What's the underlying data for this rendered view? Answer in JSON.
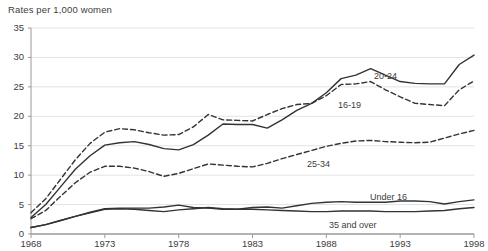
{
  "chart_data": {
    "type": "line",
    "title": "Rates per 1,000 women",
    "xlabel": "",
    "ylabel": "Rates per 1,000 women",
    "xlim": [
      1968,
      1998
    ],
    "ylim": [
      0,
      35
    ],
    "grid": true,
    "legend_position": "inline-annotations",
    "x_ticks": [
      "1968",
      "1973",
      "1978",
      "1983",
      "1988",
      "1993",
      "1998"
    ],
    "x_tick_values": [
      1968,
      1973,
      1978,
      1983,
      1988,
      1993,
      1998
    ],
    "y_ticks": [
      "0",
      "5",
      "10",
      "15",
      "20",
      "25",
      "30",
      "35"
    ],
    "y_tick_values": [
      0,
      5,
      10,
      15,
      20,
      25,
      30,
      35
    ],
    "x": [
      1968,
      1969,
      1970,
      1971,
      1972,
      1973,
      1974,
      1975,
      1976,
      1977,
      1978,
      1979,
      1980,
      1981,
      1982,
      1983,
      1984,
      1985,
      1986,
      1987,
      1988,
      1989,
      1990,
      1991,
      1992,
      1993,
      1994,
      1995,
      1996,
      1997,
      1998
    ],
    "series": [
      {
        "name": "20-24",
        "style": "solid",
        "color": "#333333",
        "label": "20-24",
        "values": [
          2.8,
          5.0,
          8.0,
          11.0,
          13.3,
          15.1,
          15.5,
          15.7,
          15.2,
          14.5,
          14.3,
          15.2,
          16.8,
          18.7,
          18.6,
          18.6,
          18.0,
          19.4,
          21.0,
          22.2,
          24.0,
          26.4,
          27.0,
          28.1,
          27.0,
          25.9,
          25.6,
          25.5,
          25.5,
          28.8,
          30.4
        ]
      },
      {
        "name": "16-19",
        "style": "dashed",
        "color": "#333333",
        "label": "16-19",
        "values": [
          3.6,
          6.0,
          9.3,
          12.6,
          15.4,
          17.3,
          17.9,
          17.7,
          17.2,
          16.8,
          16.9,
          18.2,
          20.3,
          19.4,
          19.3,
          19.2,
          20.3,
          21.3,
          22.0,
          22.2,
          23.5,
          25.4,
          25.5,
          25.9,
          24.5,
          23.3,
          22.2,
          22.0,
          21.8,
          24.5,
          26.0
        ]
      },
      {
        "name": "25-34",
        "style": "dashed",
        "color": "#333333",
        "label": "25-34",
        "values": [
          2.6,
          4.0,
          6.4,
          8.7,
          10.5,
          11.5,
          11.5,
          11.2,
          10.6,
          9.8,
          10.3,
          11.1,
          11.9,
          11.7,
          11.5,
          11.4,
          12.0,
          12.8,
          13.5,
          14.2,
          14.9,
          15.4,
          15.8,
          15.9,
          15.7,
          15.6,
          15.5,
          15.6,
          16.3,
          17.0,
          17.6
        ]
      },
      {
        "name": "Under 16",
        "style": "solid",
        "color": "#333333",
        "label": "Under 16",
        "values": [
          1.1,
          1.6,
          2.3,
          3.0,
          3.7,
          4.3,
          4.4,
          4.4,
          4.4,
          4.6,
          4.9,
          4.5,
          4.4,
          4.2,
          4.2,
          4.5,
          4.6,
          4.4,
          4.8,
          5.2,
          5.4,
          5.5,
          5.4,
          5.4,
          5.4,
          5.6,
          5.6,
          5.5,
          5.1,
          5.5,
          5.8
        ]
      },
      {
        "name": "35 and over",
        "style": "solid",
        "color": "#333333",
        "label": "35 and over",
        "values": [
          1.1,
          1.6,
          2.3,
          3.0,
          3.6,
          4.2,
          4.3,
          4.2,
          4.0,
          3.8,
          4.1,
          4.3,
          4.5,
          4.3,
          4.2,
          4.2,
          4.1,
          4.0,
          3.9,
          3.8,
          3.8,
          3.9,
          3.9,
          3.9,
          3.8,
          3.8,
          3.8,
          3.9,
          4.0,
          4.3,
          4.5
        ]
      }
    ],
    "annotations": [
      {
        "text": "20-24",
        "series": "20-24",
        "x_px": 374,
        "y_px": 71
      },
      {
        "text": "16-19",
        "series": "16-19",
        "x_px": 338,
        "y_px": 100
      },
      {
        "text": "25-34",
        "series": "25-34",
        "x_px": 307,
        "y_px": 159
      },
      {
        "text": "Under 16",
        "series": "Under 16",
        "x_px": 370,
        "y_px": 192
      },
      {
        "text": "35 and over",
        "series": "35 and over",
        "x_px": 329,
        "y_px": 220
      }
    ],
    "colors": {
      "line": "#333333",
      "grid": "#e3e3e3",
      "axis": "#9a9a9a",
      "text": "#3d3d3d",
      "background": "#ffffff"
    }
  }
}
